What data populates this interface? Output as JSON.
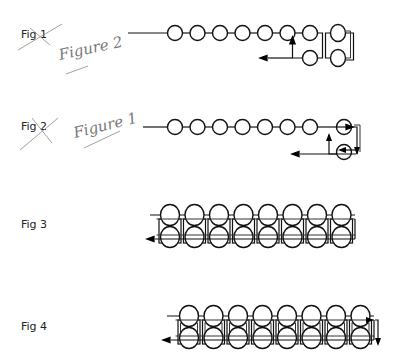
{
  "figures": [
    {
      "id": "fig1",
      "label": "Fig 1",
      "struck_out": true,
      "handwritten_label": "Figure 2",
      "beads_in_row": 6,
      "extra_column_pairs": 2,
      "arrows": [
        "up",
        "left"
      ]
    },
    {
      "id": "fig2",
      "label": "Fig 2",
      "struck_out": true,
      "handwritten_label": "Figure 1",
      "beads_in_row": 7,
      "extra_column_pairs": 1,
      "arrows": [
        "right",
        "down",
        "up",
        "left"
      ]
    },
    {
      "id": "fig3",
      "label": "Fig 3",
      "struck_out": false,
      "columns": 8,
      "arrows": [
        "left"
      ]
    },
    {
      "id": "fig4",
      "label": "Fig 4",
      "struck_out": false,
      "columns": 8,
      "arrows": [
        "right",
        "down",
        "left"
      ]
    }
  ],
  "colors": {
    "ink": "#111111",
    "pencil": "#777777",
    "background": "#ffffff"
  }
}
